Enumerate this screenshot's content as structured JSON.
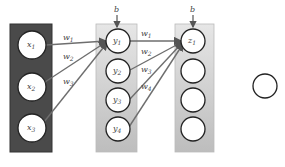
{
  "diagram": {
    "type": "neural-network",
    "colors": {
      "input_panel": "#4a4a4a",
      "hidden_panel_top": "#e6e6e6",
      "hidden_panel_bottom": "#bdbdbd",
      "node_fill": "#ffffff",
      "node_stroke": "#222222",
      "edge": "#6e6e6e"
    },
    "input_layer": {
      "nodes": [
        {
          "label": "x",
          "sub": "1"
        },
        {
          "label": "x",
          "sub": "2"
        },
        {
          "label": "x",
          "sub": "3"
        }
      ]
    },
    "hidden_layer_1": {
      "bias_label": "b",
      "nodes": [
        {
          "label": "y",
          "sub": "1"
        },
        {
          "label": "y",
          "sub": "2"
        },
        {
          "label": "y",
          "sub": "3"
        },
        {
          "label": "y",
          "sub": "4"
        }
      ]
    },
    "hidden_layer_2": {
      "bias_label": "b",
      "nodes": [
        {
          "label": "z",
          "sub": "1"
        },
        {
          "label": "",
          "sub": ""
        },
        {
          "label": "",
          "sub": ""
        },
        {
          "label": "",
          "sub": ""
        }
      ]
    },
    "output_node": {
      "label": ""
    },
    "weights_layer1": [
      {
        "label": "w",
        "sub": "1"
      },
      {
        "label": "w",
        "sub": "2"
      },
      {
        "label": "w",
        "sub": "3"
      }
    ],
    "weights_layer2": [
      {
        "label": "w",
        "sub": "1"
      },
      {
        "label": "w",
        "sub": "2"
      },
      {
        "label": "w",
        "sub": "3"
      },
      {
        "label": "w",
        "sub": "4"
      }
    ]
  }
}
